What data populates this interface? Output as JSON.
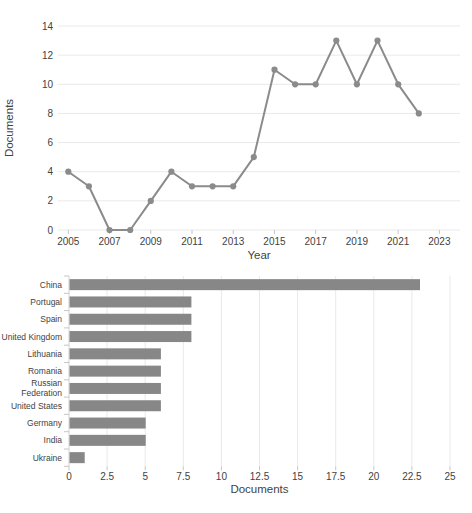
{
  "page": {
    "background": "#ffffff"
  },
  "colors": {
    "series": "#8b8b8b",
    "bar": "#878787",
    "grid": "#e9e9e9",
    "tick": "#c6c6c6",
    "axis_line": "#dcdcdc",
    "text": "#424242"
  },
  "chart_data": [
    {
      "type": "line",
      "title": "",
      "xlabel": "Year",
      "ylabel": "Documents",
      "x": [
        2005,
        2006,
        2007,
        2008,
        2009,
        2010,
        2011,
        2012,
        2013,
        2014,
        2015,
        2016,
        2017,
        2018,
        2019,
        2020,
        2021,
        2022
      ],
      "values": [
        4,
        3,
        0,
        0,
        2,
        4,
        3,
        3,
        3,
        5,
        11,
        10,
        10,
        13,
        10,
        13,
        10,
        8
      ],
      "xticks": [
        2005,
        2007,
        2009,
        2011,
        2013,
        2015,
        2017,
        2019,
        2021,
        2023
      ],
      "yticks": [
        0,
        2,
        4,
        6,
        8,
        10,
        12,
        14
      ],
      "xlim": [
        2004.5,
        2024
      ],
      "ylim": [
        0,
        14
      ],
      "grid": true,
      "legend": false,
      "marker": "circle"
    },
    {
      "type": "bar",
      "orientation": "horizontal",
      "title": "",
      "xlabel": "Documents",
      "ylabel": "",
      "categories": [
        "China",
        "Portugal",
        "Spain",
        "United Kingdom",
        "Lithuania",
        "Romania",
        "Russian Federation",
        "United States",
        "Germany",
        "India",
        "Ukraine"
      ],
      "values": [
        23,
        8,
        8,
        8,
        6,
        6,
        6,
        6,
        5,
        5,
        1
      ],
      "xticks": [
        0,
        2.5,
        5,
        7.5,
        10,
        12.5,
        15,
        17.5,
        20,
        22.5,
        25
      ],
      "xlim": [
        0,
        25
      ],
      "grid": true,
      "legend": false
    }
  ]
}
